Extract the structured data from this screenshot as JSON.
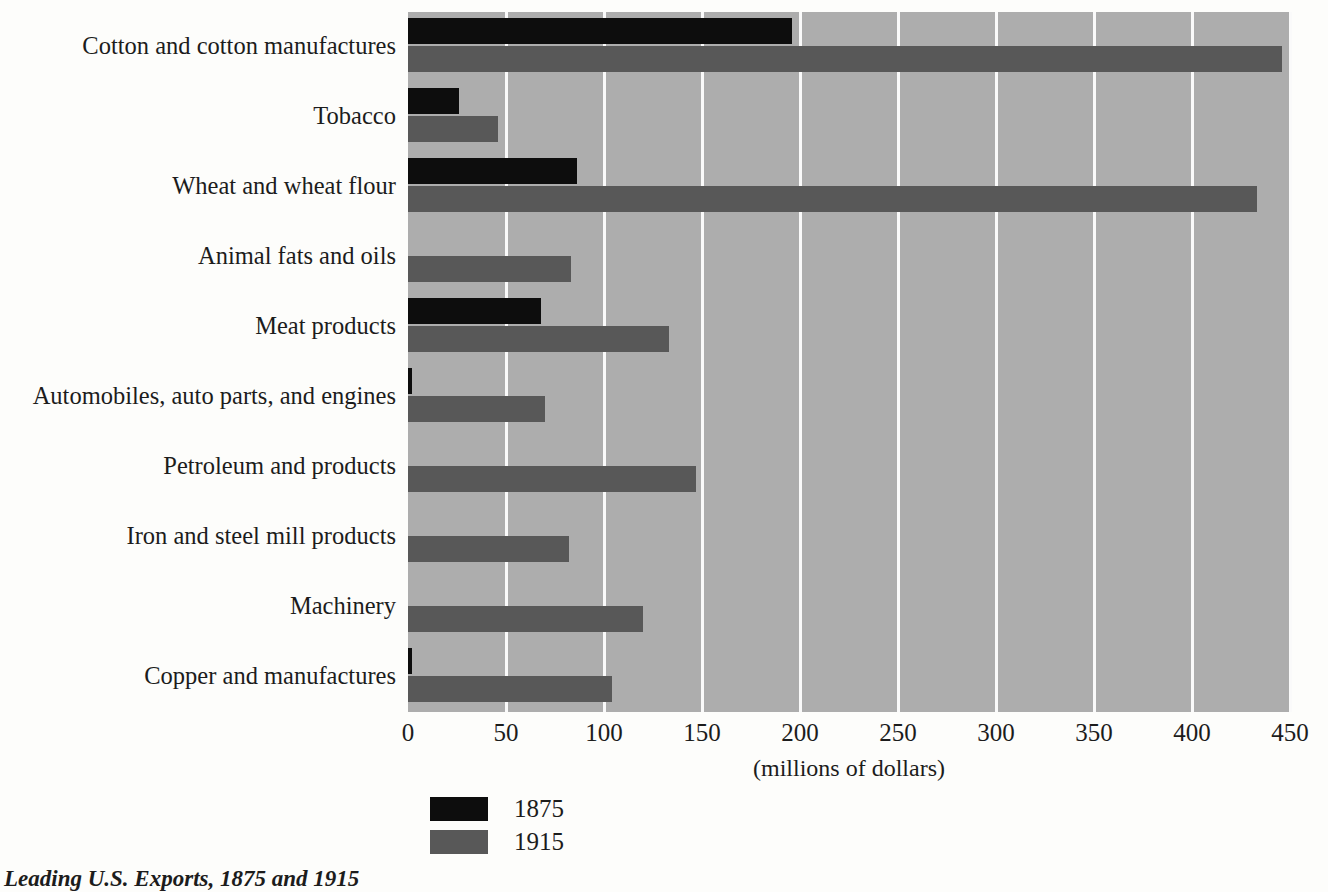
{
  "caption": "Leading U.S. Exports, 1875 and 1915",
  "axis": {
    "x_title": "(millions of dollars)",
    "x_ticks": [
      "0",
      "50",
      "100",
      "150",
      "200",
      "250",
      "300",
      "350",
      "400",
      "450"
    ]
  },
  "legend": {
    "items": [
      {
        "label": "1875",
        "color": "#0d0d0d"
      },
      {
        "label": "1915",
        "color": "#585858"
      }
    ]
  },
  "colors": {
    "plot_background": "#adadad",
    "gridline": "#fafafa",
    "series_1875": "#0d0d0d",
    "series_1915": "#585858",
    "page_background": "#fdfdfb",
    "text": "#1c1c1c"
  },
  "chart_data": {
    "type": "bar",
    "orientation": "horizontal",
    "title": "Leading U.S. Exports, 1875 and 1915",
    "xlabel": "(millions of dollars)",
    "ylabel": "",
    "xlim": [
      0,
      450
    ],
    "xticks": [
      0,
      50,
      100,
      150,
      200,
      250,
      300,
      350,
      400,
      450
    ],
    "grid": true,
    "legend_position": "bottom-left",
    "categories": [
      "Cotton and cotton manufactures",
      "Tobacco",
      "Wheat and wheat flour",
      "Animal fats and oils",
      "Meat products",
      "Automobiles, auto parts, and engines",
      "Petroleum and products",
      "Iron and steel mill products",
      "Machinery",
      "Copper and manufactures"
    ],
    "series": [
      {
        "name": "1875",
        "color": "#0d0d0d",
        "values": [
          196,
          26,
          86,
          0,
          68,
          2,
          0,
          0,
          0,
          2
        ]
      },
      {
        "name": "1915",
        "color": "#585858",
        "values": [
          446,
          46,
          433,
          83,
          133,
          70,
          147,
          82,
          120,
          104
        ]
      }
    ]
  }
}
